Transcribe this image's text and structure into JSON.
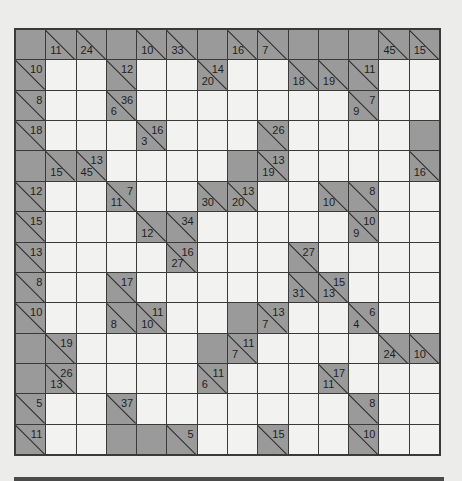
{
  "puzzle": {
    "type": "kakuro",
    "rows": 14,
    "cols": 14,
    "colors": {
      "clue_cell": "#9a9a9a",
      "white_cell": "#f2f2f0",
      "grid_line": "#3a3a3a"
    },
    "grid": [
      [
        {
          "t": "B"
        },
        {
          "t": "C",
          "d": "11"
        },
        {
          "t": "C",
          "d": "24"
        },
        {
          "t": "B"
        },
        {
          "t": "C",
          "d": "10"
        },
        {
          "t": "C",
          "d": "33"
        },
        {
          "t": "B"
        },
        {
          "t": "C",
          "d": "16"
        },
        {
          "t": "C",
          "d": "7"
        },
        {
          "t": "B"
        },
        {
          "t": "B"
        },
        {
          "t": "B"
        },
        {
          "t": "C",
          "d": "45"
        },
        {
          "t": "C",
          "d": "15"
        }
      ],
      [
        {
          "t": "C",
          "a": "10"
        },
        {
          "t": "W"
        },
        {
          "t": "W"
        },
        {
          "t": "C",
          "a": "12"
        },
        {
          "t": "W"
        },
        {
          "t": "W"
        },
        {
          "t": "C",
          "d": "20",
          "a": "14"
        },
        {
          "t": "W"
        },
        {
          "t": "W"
        },
        {
          "t": "C",
          "d": "18"
        },
        {
          "t": "C",
          "d": "19"
        },
        {
          "t": "C",
          "a": "11"
        },
        {
          "t": "W"
        },
        {
          "t": "W"
        }
      ],
      [
        {
          "t": "C",
          "a": "8"
        },
        {
          "t": "W"
        },
        {
          "t": "W"
        },
        {
          "t": "C",
          "d": "6",
          "a": "36"
        },
        {
          "t": "W"
        },
        {
          "t": "W"
        },
        {
          "t": "W"
        },
        {
          "t": "W"
        },
        {
          "t": "W"
        },
        {
          "t": "W"
        },
        {
          "t": "W"
        },
        {
          "t": "C",
          "d": "9",
          "a": "7"
        },
        {
          "t": "W"
        },
        {
          "t": "W"
        }
      ],
      [
        {
          "t": "C",
          "a": "18"
        },
        {
          "t": "W"
        },
        {
          "t": "W"
        },
        {
          "t": "W"
        },
        {
          "t": "C",
          "d": "3",
          "a": "16"
        },
        {
          "t": "W"
        },
        {
          "t": "W"
        },
        {
          "t": "W"
        },
        {
          "t": "C",
          "a": "26"
        },
        {
          "t": "W"
        },
        {
          "t": "W"
        },
        {
          "t": "W"
        },
        {
          "t": "W"
        },
        {
          "t": "B"
        }
      ],
      [
        {
          "t": "B"
        },
        {
          "t": "C",
          "d": "15"
        },
        {
          "t": "C",
          "d": "45",
          "a": "13"
        },
        {
          "t": "W"
        },
        {
          "t": "W"
        },
        {
          "t": "W"
        },
        {
          "t": "W"
        },
        {
          "t": "B"
        },
        {
          "t": "C",
          "d": "19",
          "a": "13"
        },
        {
          "t": "W"
        },
        {
          "t": "W"
        },
        {
          "t": "W"
        },
        {
          "t": "W"
        },
        {
          "t": "C",
          "d": "16"
        }
      ],
      [
        {
          "t": "C",
          "a": "12"
        },
        {
          "t": "W"
        },
        {
          "t": "W"
        },
        {
          "t": "C",
          "d": "11",
          "a": "7"
        },
        {
          "t": "W"
        },
        {
          "t": "W"
        },
        {
          "t": "C",
          "d": "30"
        },
        {
          "t": "C",
          "d": "20",
          "a": "13"
        },
        {
          "t": "W"
        },
        {
          "t": "W"
        },
        {
          "t": "C",
          "d": "10"
        },
        {
          "t": "C",
          "a": "8"
        },
        {
          "t": "W"
        },
        {
          "t": "W"
        }
      ],
      [
        {
          "t": "C",
          "a": "15"
        },
        {
          "t": "W"
        },
        {
          "t": "W"
        },
        {
          "t": "W"
        },
        {
          "t": "C",
          "d": "12"
        },
        {
          "t": "C",
          "a": "34"
        },
        {
          "t": "W"
        },
        {
          "t": "W"
        },
        {
          "t": "W"
        },
        {
          "t": "W"
        },
        {
          "t": "W"
        },
        {
          "t": "C",
          "d": "9",
          "a": "10"
        },
        {
          "t": "W"
        },
        {
          "t": "W"
        }
      ],
      [
        {
          "t": "C",
          "a": "13"
        },
        {
          "t": "W"
        },
        {
          "t": "W"
        },
        {
          "t": "W"
        },
        {
          "t": "W"
        },
        {
          "t": "C",
          "d": "27",
          "a": "16"
        },
        {
          "t": "W"
        },
        {
          "t": "W"
        },
        {
          "t": "W"
        },
        {
          "t": "C",
          "a": "27"
        },
        {
          "t": "W"
        },
        {
          "t": "W"
        },
        {
          "t": "W"
        },
        {
          "t": "W"
        }
      ],
      [
        {
          "t": "C",
          "a": "8"
        },
        {
          "t": "W"
        },
        {
          "t": "W"
        },
        {
          "t": "C",
          "a": "17"
        },
        {
          "t": "W"
        },
        {
          "t": "W"
        },
        {
          "t": "W"
        },
        {
          "t": "W"
        },
        {
          "t": "W"
        },
        {
          "t": "C",
          "d": "31"
        },
        {
          "t": "C",
          "d": "13",
          "a": "15"
        },
        {
          "t": "W"
        },
        {
          "t": "W"
        },
        {
          "t": "W"
        }
      ],
      [
        {
          "t": "C",
          "a": "10"
        },
        {
          "t": "W"
        },
        {
          "t": "W"
        },
        {
          "t": "C",
          "d": "8"
        },
        {
          "t": "C",
          "d": "10",
          "a": "11"
        },
        {
          "t": "W"
        },
        {
          "t": "W"
        },
        {
          "t": "B"
        },
        {
          "t": "C",
          "d": "7",
          "a": "13"
        },
        {
          "t": "W"
        },
        {
          "t": "W"
        },
        {
          "t": "C",
          "d": "4",
          "a": "6"
        },
        {
          "t": "W"
        },
        {
          "t": "W"
        }
      ],
      [
        {
          "t": "B"
        },
        {
          "t": "C",
          "a": "19"
        },
        {
          "t": "W"
        },
        {
          "t": "W"
        },
        {
          "t": "W"
        },
        {
          "t": "W"
        },
        {
          "t": "B"
        },
        {
          "t": "C",
          "d": "7",
          "a": "11"
        },
        {
          "t": "W"
        },
        {
          "t": "W"
        },
        {
          "t": "W"
        },
        {
          "t": "W"
        },
        {
          "t": "C",
          "d": "24"
        },
        {
          "t": "C",
          "d": "10"
        }
      ],
      [
        {
          "t": "B"
        },
        {
          "t": "C",
          "d": "13",
          "a": "26"
        },
        {
          "t": "W"
        },
        {
          "t": "W"
        },
        {
          "t": "W"
        },
        {
          "t": "W"
        },
        {
          "t": "C",
          "d": "6",
          "a": "11"
        },
        {
          "t": "W"
        },
        {
          "t": "W"
        },
        {
          "t": "W"
        },
        {
          "t": "C",
          "d": "11",
          "a": "17"
        },
        {
          "t": "W"
        },
        {
          "t": "W"
        },
        {
          "t": "W"
        }
      ],
      [
        {
          "t": "C",
          "a": "5"
        },
        {
          "t": "W"
        },
        {
          "t": "W"
        },
        {
          "t": "C",
          "a": "37"
        },
        {
          "t": "W"
        },
        {
          "t": "W"
        },
        {
          "t": "W"
        },
        {
          "t": "W"
        },
        {
          "t": "W"
        },
        {
          "t": "W"
        },
        {
          "t": "W"
        },
        {
          "t": "C",
          "a": "8"
        },
        {
          "t": "W"
        },
        {
          "t": "W"
        }
      ],
      [
        {
          "t": "C",
          "a": "11"
        },
        {
          "t": "W"
        },
        {
          "t": "W"
        },
        {
          "t": "B"
        },
        {
          "t": "B"
        },
        {
          "t": "C",
          "a": "5"
        },
        {
          "t": "W"
        },
        {
          "t": "W"
        },
        {
          "t": "C",
          "a": "15"
        },
        {
          "t": "W"
        },
        {
          "t": "W"
        },
        {
          "t": "C",
          "a": "10"
        },
        {
          "t": "W"
        },
        {
          "t": "W"
        }
      ]
    ]
  }
}
